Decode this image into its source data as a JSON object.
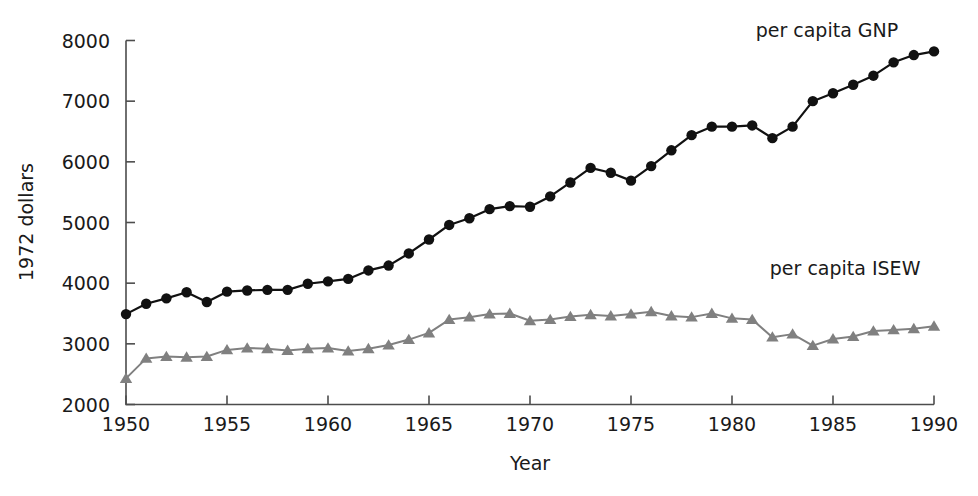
{
  "chart_data": {
    "type": "line",
    "title": "",
    "xlabel": "Year",
    "ylabel": "1972 dollars",
    "xlim": [
      1950,
      1990
    ],
    "ylim": [
      2000,
      8000
    ],
    "xticks": [
      1950,
      1955,
      1960,
      1965,
      1970,
      1975,
      1980,
      1985,
      1990
    ],
    "xtick_labels": [
      "1950",
      "1955",
      "1960",
      "1965",
      "1970",
      "1975",
      "1980",
      "1985",
      "1990"
    ],
    "yticks": [
      2000,
      3000,
      4000,
      5000,
      6000,
      7000,
      8000
    ],
    "ytick_labels": [
      "2000",
      "3000",
      "4000",
      "5000",
      "6000",
      "7000",
      "8000"
    ],
    "grid": false,
    "legend_position": "inline-annotation",
    "x": [
      1950,
      1951,
      1952,
      1953,
      1954,
      1955,
      1956,
      1957,
      1958,
      1959,
      1960,
      1961,
      1962,
      1963,
      1964,
      1965,
      1966,
      1967,
      1968,
      1969,
      1970,
      1971,
      1972,
      1973,
      1974,
      1975,
      1976,
      1977,
      1978,
      1979,
      1980,
      1981,
      1982,
      1983,
      1984,
      1985,
      1986,
      1987,
      1988,
      1989,
      1990
    ],
    "series": [
      {
        "name": "per capita GNP",
        "label": "per capita GNP",
        "color": "#111111",
        "marker": "circle",
        "values": [
          3490,
          3660,
          3750,
          3850,
          3690,
          3860,
          3880,
          3890,
          3890,
          3990,
          4030,
          4070,
          4210,
          4290,
          4490,
          4720,
          4960,
          5070,
          5220,
          5270,
          5260,
          5430,
          5660,
          5900,
          5820,
          5690,
          5930,
          6190,
          6440,
          6580,
          6580,
          6600,
          6390,
          6580,
          7000,
          7130,
          7270,
          7420,
          7640,
          7760,
          7820
        ]
      },
      {
        "name": "per capita ISEW",
        "label": "per capita ISEW",
        "color": "#808080",
        "marker": "triangle",
        "values": [
          2430,
          2760,
          2790,
          2780,
          2790,
          2900,
          2930,
          2920,
          2890,
          2920,
          2930,
          2880,
          2920,
          2980,
          3070,
          3180,
          3400,
          3440,
          3490,
          3500,
          3380,
          3400,
          3450,
          3480,
          3460,
          3490,
          3530,
          3460,
          3440,
          3500,
          3420,
          3400,
          3110,
          3160,
          2970,
          3080,
          3120,
          3210,
          3230,
          3250,
          3290
        ]
      }
    ],
    "annotations": [
      {
        "text": "per capita GNP",
        "x": 1984.7,
        "y": 8060
      },
      {
        "text": "per capita ISEW",
        "x": 1985.6,
        "y": 4130
      }
    ]
  }
}
